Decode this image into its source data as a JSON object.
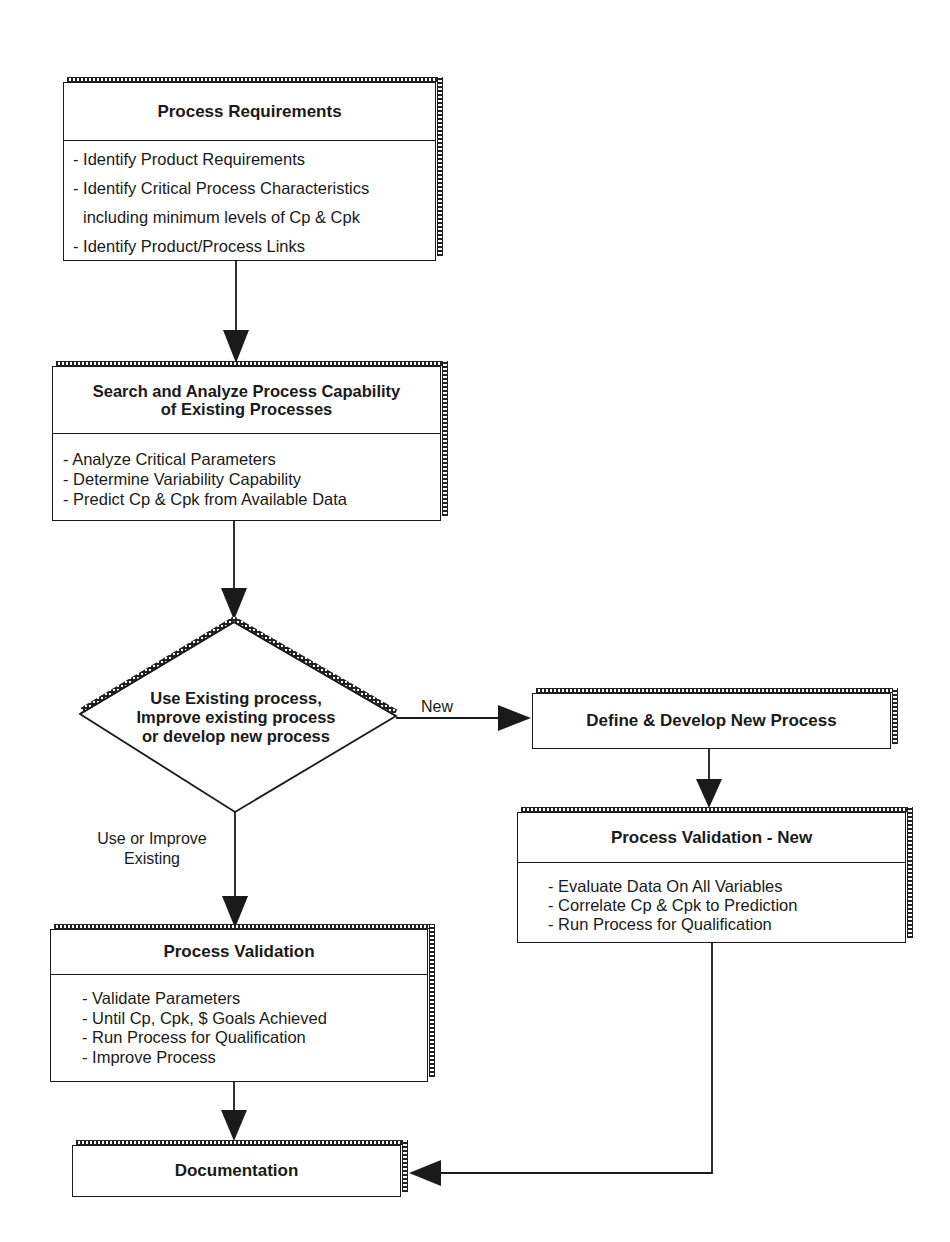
{
  "diagram": {
    "type": "flowchart",
    "nodes": {
      "process_requirements": {
        "title": "Process Requirements",
        "items": [
          "- Identify Product Requirements",
          "- Identify Critical Process Characteristics",
          "  including minimum levels of Cp & Cpk",
          "- Identify Product/Process Links"
        ]
      },
      "search_analyze": {
        "title_line1": "Search and Analyze Process Capability",
        "title_line2": "of Existing Processes",
        "items": [
          "- Analyze  Critical Parameters",
          "- Determine Variability Capability",
          "- Predict Cp & Cpk from Available Data"
        ]
      },
      "decision": {
        "line1": "Use Existing process,",
        "line2": "Improve existing process",
        "line3": "or develop new process"
      },
      "define_develop": {
        "title": "Define & Develop New Process"
      },
      "process_validation_new": {
        "title": "Process Validation - New",
        "items": [
          "- Evaluate Data On All Variables",
          "- Correlate Cp & Cpk to Prediction",
          "- Run Process for Qualification"
        ]
      },
      "process_validation": {
        "title": "Process Validation",
        "items": [
          "- Validate Parameters",
          "- Until Cp, Cpk, $ Goals Achieved",
          "- Run Process for Qualification",
          "- Improve Process"
        ]
      },
      "documentation": {
        "title": "Documentation"
      }
    },
    "edges": {
      "new_label": "New",
      "existing_label_line1": "Use or Improve",
      "existing_label_line2": "Existing"
    },
    "colors": {
      "stroke": "#1a1a1a",
      "background": "#ffffff"
    }
  }
}
